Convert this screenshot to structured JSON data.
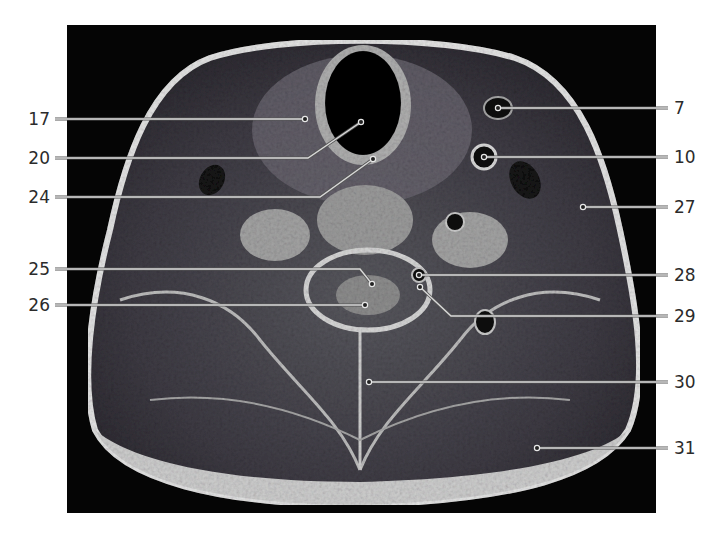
{
  "figure": {
    "type": "axial-mri-neck",
    "image_bounds": {
      "x": 67,
      "y": 25,
      "w": 589,
      "h": 488
    },
    "colors": {
      "background": "#ffffff",
      "scan_background": "#050505",
      "label_text": "#2b2b2b",
      "leader_line": "#d8d8d8"
    }
  },
  "labels": [
    {
      "id": "17",
      "text": "17",
      "side": "left",
      "ty": 119,
      "pts": [
        [
          55,
          119
        ],
        [
          305,
          119
        ]
      ]
    },
    {
      "id": "20",
      "text": "20",
      "side": "left",
      "ty": 158,
      "pts": [
        [
          55,
          158
        ],
        [
          308,
          158
        ],
        [
          361,
          122
        ]
      ]
    },
    {
      "id": "24",
      "text": "24",
      "side": "left",
      "ty": 197,
      "pts": [
        [
          55,
          197
        ],
        [
          320,
          197
        ],
        [
          373,
          159
        ]
      ]
    },
    {
      "id": "25",
      "text": "25",
      "side": "left",
      "ty": 269,
      "pts": [
        [
          55,
          269
        ],
        [
          360,
          269
        ],
        [
          372,
          284
        ]
      ]
    },
    {
      "id": "26",
      "text": "26",
      "side": "left",
      "ty": 305,
      "pts": [
        [
          55,
          305
        ],
        [
          365,
          305
        ]
      ]
    },
    {
      "id": "7",
      "text": "7",
      "side": "right",
      "ty": 108,
      "pts": [
        [
          668,
          108
        ],
        [
          498,
          108
        ]
      ]
    },
    {
      "id": "10",
      "text": "10",
      "side": "right",
      "ty": 157,
      "pts": [
        [
          668,
          157
        ],
        [
          484,
          157
        ]
      ]
    },
    {
      "id": "27",
      "text": "27",
      "side": "right",
      "ty": 207,
      "pts": [
        [
          668,
          207
        ],
        [
          583,
          207
        ]
      ]
    },
    {
      "id": "28",
      "text": "28",
      "side": "right",
      "ty": 275,
      "pts": [
        [
          668,
          275
        ],
        [
          419,
          275
        ]
      ]
    },
    {
      "id": "29",
      "text": "29",
      "side": "right",
      "ty": 316,
      "pts": [
        [
          668,
          316
        ],
        [
          451,
          316
        ],
        [
          420,
          287
        ]
      ]
    },
    {
      "id": "30",
      "text": "30",
      "side": "right",
      "ty": 382,
      "pts": [
        [
          668,
          382
        ],
        [
          369,
          382
        ]
      ]
    },
    {
      "id": "31",
      "text": "31",
      "side": "right",
      "ty": 448,
      "pts": [
        [
          668,
          448
        ],
        [
          537,
          448
        ]
      ]
    }
  ]
}
